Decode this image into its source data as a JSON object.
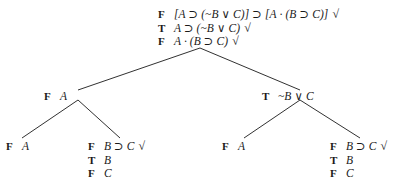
{
  "diagram": {
    "ink_color": "#1a1a1a",
    "background_color": "#ffffff",
    "check_glyph": "√",
    "symbols": {
      "horseshoe": "⊃",
      "wedge": "∨",
      "dot": "·",
      "tilde": "~",
      "bracket_open": "[",
      "bracket_close": "]",
      "paren_open": "(",
      "paren_close": ")"
    },
    "truth_values": {
      "true_label": "T",
      "false_label": "F"
    },
    "nodes": {
      "root": {
        "lines": [
          {
            "tv": "F",
            "formula": "[A ⊃ (~B ∨ C)] ⊃ [A · (B ⊃ C)]",
            "check": "√"
          },
          {
            "tv": "T",
            "formula": "A ⊃ (~B ∨ C)",
            "check": "√"
          },
          {
            "tv": "F",
            "formula": "A · (B ⊃ C)",
            "check": "√"
          }
        ]
      },
      "left1": {
        "lines": [
          {
            "tv": "F",
            "formula": "A",
            "check": ""
          }
        ]
      },
      "right1": {
        "lines": [
          {
            "tv": "T",
            "formula": "~B ∨ C",
            "check": ""
          }
        ]
      },
      "leaf_ll": {
        "lines": [
          {
            "tv": "F",
            "formula": "A",
            "check": ""
          }
        ]
      },
      "leaf_lr": {
        "lines": [
          {
            "tv": "F",
            "formula": "B ⊃ C",
            "check": "√"
          },
          {
            "tv": "T",
            "formula": "B",
            "check": ""
          },
          {
            "tv": "F",
            "formula": "C",
            "check": ""
          }
        ]
      },
      "leaf_rl": {
        "lines": [
          {
            "tv": "F",
            "formula": "A",
            "check": ""
          }
        ]
      },
      "leaf_rr": {
        "lines": [
          {
            "tv": "F",
            "formula": "B ⊃ C",
            "check": "√"
          },
          {
            "tv": "T",
            "formula": "B",
            "check": ""
          },
          {
            "tv": "F",
            "formula": "C",
            "check": ""
          }
        ]
      }
    },
    "edges": [
      {
        "name": "root-to-left1",
        "x1": 200,
        "y1": 48,
        "x2": 78,
        "y2": 90
      },
      {
        "name": "root-to-right1",
        "x1": 200,
        "y1": 48,
        "x2": 300,
        "y2": 90
      },
      {
        "name": "left1-to-leaf-ll",
        "x1": 78,
        "y1": 100,
        "x2": 22,
        "y2": 138
      },
      {
        "name": "left1-to-leaf-lr",
        "x1": 78,
        "y1": 100,
        "x2": 120,
        "y2": 138
      },
      {
        "name": "right1-to-leaf-rl",
        "x1": 300,
        "y1": 100,
        "x2": 244,
        "y2": 138
      },
      {
        "name": "right1-to-leaf-rr",
        "x1": 300,
        "y1": 100,
        "x2": 360,
        "y2": 138
      }
    ]
  }
}
